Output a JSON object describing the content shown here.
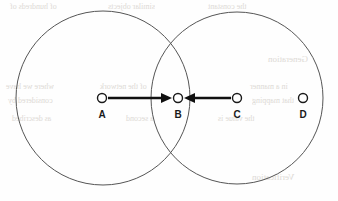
{
  "figure": {
    "canvas": {
      "width": 338,
      "height": 201
    },
    "background_color": "#fefefe",
    "outline_color": "#555555",
    "marker_color": "#1a1a1a",
    "arrow_color": "#101010"
  },
  "chart_data": {
    "type": "diagram",
    "title": "",
    "xlabel": "",
    "ylabel": "",
    "circles": [
      {
        "name": "left-circle",
        "cx": 103,
        "cy": 98,
        "r": 87
      },
      {
        "name": "right-circle",
        "cx": 237,
        "cy": 98,
        "r": 86
      }
    ],
    "points": [
      {
        "label": "A",
        "cx": 102,
        "cy": 98,
        "r": 4.5,
        "inside": "left-circle"
      },
      {
        "label": "B",
        "cx": 178,
        "cy": 98,
        "r": 4.5,
        "inside": "overlap"
      },
      {
        "label": "C",
        "cx": 237,
        "cy": 98,
        "r": 4.5,
        "inside": "right-circle"
      },
      {
        "label": "D",
        "cx": 303,
        "cy": 98,
        "r": 4.5,
        "inside": "right-circle"
      }
    ],
    "arrows": [
      {
        "name": "arrow-a-to-b",
        "from": "A",
        "to": "B",
        "x1": 108,
        "y1": 98,
        "x2": 172,
        "y2": 98,
        "direction": "right"
      },
      {
        "name": "arrow-c-to-b",
        "from": "C",
        "to": "B",
        "x1": 231,
        "y1": 98,
        "x2": 184,
        "y2": 98,
        "direction": "left"
      }
    ],
    "legend": [],
    "annotations": []
  },
  "labels": {
    "a": "A",
    "b": "B",
    "c": "C",
    "d": "D"
  },
  "bleed_text": [
    {
      "text": "of hundreds of",
      "x": 10,
      "y": 2,
      "size": 8
    },
    {
      "text": "similar objects",
      "x": 108,
      "y": 2,
      "size": 8
    },
    {
      "text": "the constant",
      "x": 208,
      "y": 2,
      "size": 8
    },
    {
      "text": "Generation",
      "x": 268,
      "y": 54,
      "size": 9
    },
    {
      "text": "where we have",
      "x": 6,
      "y": 82,
      "size": 8
    },
    {
      "text": "of the network",
      "x": 100,
      "y": 82,
      "size": 8
    },
    {
      "text": "in a manner",
      "x": 250,
      "y": 82,
      "size": 8
    },
    {
      "text": "considered by",
      "x": 8,
      "y": 96,
      "size": 8
    },
    {
      "text": "that mapping",
      "x": 252,
      "y": 96,
      "size": 8
    },
    {
      "text": "as described",
      "x": 12,
      "y": 114,
      "size": 8
    },
    {
      "text": "a second",
      "x": 126,
      "y": 114,
      "size": 8
    },
    {
      "text": "the value is",
      "x": 218,
      "y": 114,
      "size": 8
    },
    {
      "text": "Verification",
      "x": 252,
      "y": 172,
      "size": 9
    }
  ]
}
